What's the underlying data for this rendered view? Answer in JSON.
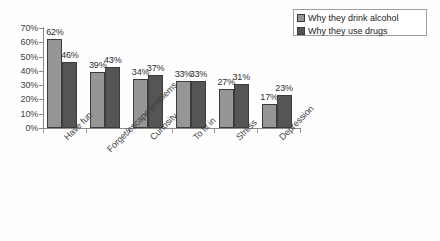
{
  "chart_data": {
    "type": "bar",
    "title": "",
    "subtitle": "",
    "xlabel": "",
    "ylabel": "",
    "ylim": [
      0,
      70
    ],
    "ytick_step": 10,
    "ytick_labels": [
      "70%",
      "60%",
      "50%",
      "40%",
      "30%",
      "20%",
      "10%",
      "0%"
    ],
    "ytick_values": [
      70,
      60,
      50,
      40,
      30,
      20,
      10,
      0
    ],
    "grid": false,
    "legend_position": "top-right",
    "value_suffix": "%",
    "categories": [
      "Have fun",
      "Forget/escape problems",
      "Curiosity",
      "To fit in",
      "Stress",
      "Depression"
    ],
    "series": [
      {
        "name": "Why they drink alcohol",
        "color": "#969696",
        "values": [
          62,
          39,
          34,
          33,
          27,
          17
        ],
        "labels": [
          "62%",
          "39%",
          "34%",
          "33%",
          "27%",
          "17%"
        ]
      },
      {
        "name": "Why they use drugs",
        "color": "#555555",
        "values": [
          46,
          43,
          37,
          33,
          31,
          23
        ],
        "labels": [
          "46%",
          "43%",
          "37%",
          "33%",
          "31%",
          "23%"
        ]
      }
    ]
  },
  "legend": {
    "entries": [
      {
        "label": "Why they drink alcohol",
        "swatch": "#969696"
      },
      {
        "label": "Why they use drugs",
        "swatch": "#555555"
      }
    ]
  },
  "axis": {
    "y_labels": [
      "70%",
      "60%",
      "50%",
      "40%",
      "30%",
      "20%",
      "10%",
      "0%"
    ]
  },
  "colors": {
    "series_light": "#969696",
    "series_dark": "#555555",
    "axis": "#8a8a8a",
    "bar_border": "#3b3b3b",
    "text": "#3f3f3f",
    "legend_border": "#9e9e9e",
    "background": "#ffffff"
  }
}
